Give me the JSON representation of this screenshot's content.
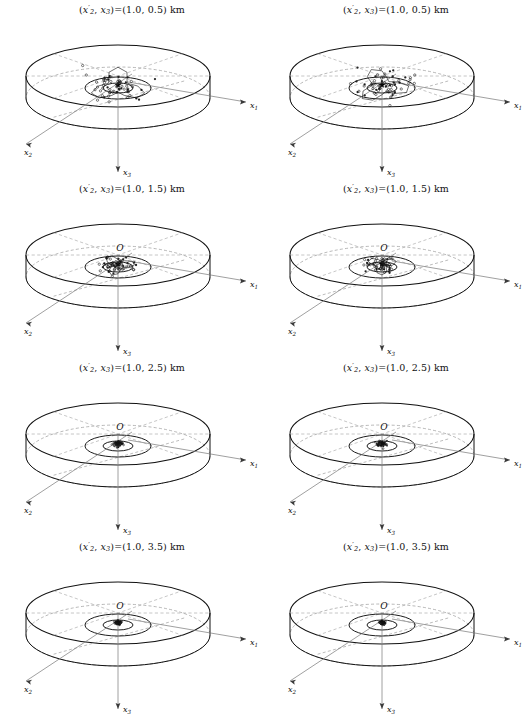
{
  "figure": {
    "name": "localization-uncertainty-panels",
    "columns": 2,
    "rows": 4,
    "background": "#ffffff",
    "ink": "#111111",
    "guide_color": "#a8a8a8"
  },
  "axes": {
    "x1_label": "x",
    "x1_sub": "1",
    "x2_label": "x",
    "x2_sub": "2",
    "x3_label": "x",
    "x3_sub": "3",
    "origin_label": "O"
  },
  "title_parts": {
    "open": "(",
    "var": "x",
    "sub_a": "2",
    "prime": "′",
    "comma": ", ",
    "sub_b": "3",
    "equals": ")=(",
    "close": ") km",
    "units": "km"
  },
  "panels": [
    {
      "id": "panel-r1-c1",
      "row": 1,
      "column": 1,
      "title": "(x′₂, x₃)=(1.0, 0.5) km",
      "x2_prime_km": 1.0,
      "x3_km": 0.5,
      "title_values": "(1.0, 0.5)",
      "origin_visible": false,
      "star_visible": true,
      "cloud": "large-dense"
    },
    {
      "id": "panel-r1-c2",
      "row": 1,
      "column": 2,
      "title": "(x′₂, x₃)=(1.0, 0.5) km",
      "x2_prime_km": 1.0,
      "x3_km": 0.5,
      "title_values": "(1.0, 0.5)",
      "origin_visible": false,
      "star_visible": true,
      "cloud": "large-dense"
    },
    {
      "id": "panel-r2-c1",
      "row": 2,
      "column": 1,
      "title": "(x′₂, x₃)=(1.0, 1.5) km",
      "x2_prime_km": 1.0,
      "x3_km": 1.5,
      "title_values": "(1.0, 1.5)",
      "origin_visible": true,
      "star_visible": true,
      "cloud": "medium-dense"
    },
    {
      "id": "panel-r2-c2",
      "row": 2,
      "column": 2,
      "title": "(x′₂, x₃)=(1.0, 1.5) km",
      "x2_prime_km": 1.0,
      "x3_km": 1.5,
      "title_values": "(1.0, 1.5)",
      "origin_visible": true,
      "star_visible": true,
      "cloud": "medium-dense"
    },
    {
      "id": "panel-r3-c1",
      "row": 3,
      "column": 1,
      "title": "(x′₂, x₃)=(1.0, 2.5) km",
      "x2_prime_km": 1.0,
      "x3_km": 2.5,
      "title_values": "(1.0, 2.5)",
      "origin_visible": true,
      "star_visible": true,
      "cloud": "small"
    },
    {
      "id": "panel-r3-c2",
      "row": 3,
      "column": 2,
      "title": "(x′₂, x₃)=(1.0, 2.5) km",
      "x2_prime_km": 1.0,
      "x3_km": 2.5,
      "title_values": "(1.0, 2.5)",
      "origin_visible": true,
      "star_visible": true,
      "cloud": "small"
    },
    {
      "id": "panel-r4-c1",
      "row": 4,
      "column": 1,
      "title": "(x′₂, x₃)=(1.0, 3.5) km",
      "x2_prime_km": 1.0,
      "x3_km": 3.5,
      "title_values": "(1.0, 3.5)",
      "origin_visible": true,
      "star_visible": true,
      "cloud": "point"
    },
    {
      "id": "panel-r4-c2",
      "row": 4,
      "column": 2,
      "title": "(x′₂, x₃)=(1.0, 3.5) km",
      "x2_prime_km": 1.0,
      "x3_km": 3.5,
      "title_values": "(1.0, 3.5)",
      "origin_visible": true,
      "star_visible": true,
      "cloud": "point"
    }
  ],
  "chart_data": {
    "type": "scatter",
    "xlabel": "x1",
    "ylabel": "x2",
    "zlabel": "x3",
    "legend": [],
    "grid": false,
    "panel_parameter": "(x2', x3)",
    "panel_parameter_units": "km",
    "panel_values": [
      {
        "x2_prime": 1.0,
        "x3": 0.5
      },
      {
        "x2_prime": 1.0,
        "x3": 0.5
      },
      {
        "x2_prime": 1.0,
        "x3": 1.5
      },
      {
        "x2_prime": 1.0,
        "x3": 1.5
      },
      {
        "x2_prime": 1.0,
        "x3": 2.5
      },
      {
        "x2_prime": 1.0,
        "x3": 2.5
      },
      {
        "x2_prime": 1.0,
        "x3": 3.5
      },
      {
        "x2_prime": 1.0,
        "x3": 3.5
      }
    ],
    "series": [
      {
        "name": "(1.0, 0.5) km left",
        "cloud_extent_rel": 1.0,
        "n_points": 60
      },
      {
        "name": "(1.0, 0.5) km right",
        "cloud_extent_rel": 0.95,
        "n_points": 60
      },
      {
        "name": "(1.0, 1.5) km left",
        "cloud_extent_rel": 0.55,
        "n_points": 60
      },
      {
        "name": "(1.0, 1.5) km right",
        "cloud_extent_rel": 0.5,
        "n_points": 60
      },
      {
        "name": "(1.0, 2.5) km left",
        "cloud_extent_rel": 0.12,
        "n_points": 60
      },
      {
        "name": "(1.0, 2.5) km right",
        "cloud_extent_rel": 0.12,
        "n_points": 60
      },
      {
        "name": "(1.0, 3.5) km left",
        "cloud_extent_rel": 0.05,
        "n_points": 60
      },
      {
        "name": "(1.0, 3.5) km right",
        "cloud_extent_rel": 0.05,
        "n_points": 60
      }
    ],
    "annotations": [
      "O",
      "x1",
      "x2",
      "x3"
    ]
  }
}
